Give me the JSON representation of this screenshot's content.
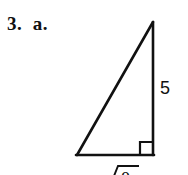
{
  "document": {
    "problem_label": "3.  a.",
    "background_color": "#ffffff",
    "ink_color": "#111111"
  },
  "figure": {
    "type": "right-triangle",
    "apex": [
      153,
      22
    ],
    "bottom_left": [
      77,
      155
    ],
    "bottom_right": [
      153,
      155
    ],
    "right_angle_corner": "bottom-right",
    "right_angle_marker_size": 12,
    "stroke_width": 2.6,
    "labels": {
      "vertical_leg": "5",
      "base_leg": "√8",
      "base_leg_radicand": "8",
      "base_leg_radical_symbol": "√"
    }
  }
}
